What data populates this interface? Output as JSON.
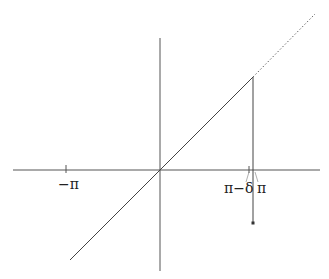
{
  "diagram": {
    "labels": {
      "neg_pi": "−π",
      "pi_minus_delta": "π−δ",
      "pi": "π"
    },
    "elements": [
      "horizontal-axis",
      "vertical-axis",
      "solid-diagonal-line",
      "dotted-extension",
      "vertical-drop-line-at-pi",
      "endpoint-dot"
    ],
    "colors": {
      "stroke": "#444444",
      "background": "#ffffff"
    }
  }
}
